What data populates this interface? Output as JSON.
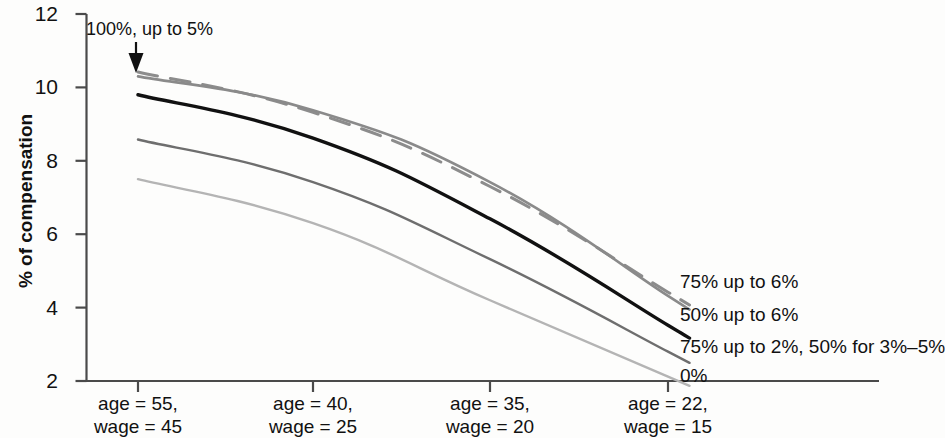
{
  "chart_data": {
    "type": "line",
    "title": "",
    "xlabel": "",
    "ylabel": "% of compensation",
    "ylim": [
      2,
      12
    ],
    "yticks": [
      2,
      4,
      6,
      8,
      10,
      12
    ],
    "grid": false,
    "legend_position": "right-inline",
    "categories": [
      "age = 55, wage = 45",
      "age = 40, wage = 25",
      "age = 35, wage = 20",
      "age = 22, wage = 15"
    ],
    "category_lines": [
      [
        "age = 55,",
        "wage = 45"
      ],
      [
        "age = 40,",
        "wage = 25"
      ],
      [
        "age = 35,",
        "wage = 20"
      ],
      [
        "age = 22,",
        "wage = 15"
      ]
    ],
    "series": [
      {
        "name": "100%, up to 5%",
        "values": [
          10.42,
          9.32,
          7.3,
          4.42
        ],
        "color": "#8c8c8c",
        "style": "dashed",
        "width": 3.0,
        "labelled_at": "annotation"
      },
      {
        "name": "75% up to 6%",
        "values": [
          10.3,
          9.38,
          7.42,
          4.32
        ],
        "color": "#8a8a8a",
        "style": "solid",
        "width": 2.6,
        "labelled_at": "right"
      },
      {
        "name": "50% up to 6%",
        "values": [
          9.8,
          8.62,
          6.42,
          3.52
        ],
        "color": "#111111",
        "style": "solid",
        "width": 3.4,
        "labelled_at": "right"
      },
      {
        "name": "75% up to 2%, 50% for 3%–5%",
        "values": [
          8.58,
          7.42,
          5.32,
          2.8
        ],
        "color": "#6e6e6e",
        "style": "solid",
        "width": 2.4,
        "labelled_at": "right"
      },
      {
        "name": "0%",
        "values": [
          7.5,
          6.3,
          4.2,
          2.12
        ],
        "color": "#b4b4b4",
        "style": "solid",
        "width": 2.4,
        "labelled_at": "right"
      }
    ],
    "annotations": [
      {
        "text": "100%, up to 5%",
        "target_series": "100%, up to 5%",
        "target_category": "age = 55, wage = 45",
        "arrow": "down"
      }
    ]
  },
  "axis": {
    "y_tick_labels": [
      "12",
      "10",
      "8",
      "6",
      "4",
      "2"
    ],
    "y_title": "% of compensation"
  },
  "series_labels": {
    "s1": "75% up to 6%",
    "s2": "50% up to 6%",
    "s3": "75% up to 2%, 50% for 3%–5%",
    "s4": "0%"
  },
  "annotation": {
    "text": "100%, up to 5%"
  }
}
